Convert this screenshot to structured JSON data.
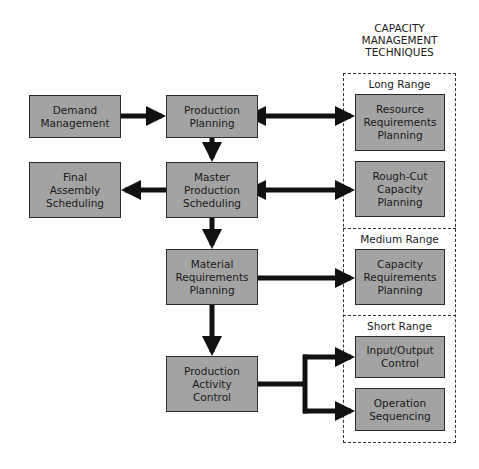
{
  "diagram": {
    "heading": "CAPACITY\nMANAGEMENT\nTECHNIQUES",
    "ranges": {
      "long": "Long Range",
      "medium": "Medium Range",
      "short": "Short Range"
    },
    "left_column": {
      "demand_management": "Demand\nManagement",
      "final_assembly_scheduling": "Final\nAssembly\nScheduling"
    },
    "center_column": {
      "production_planning": "Production\nPlanning",
      "master_production_scheduling": "Master\nProduction\nScheduling",
      "material_requirements_planning": "Material\nRequirements\nPlanning",
      "production_activity_control": "Production\nActivity\nControl"
    },
    "right_column": {
      "resource_requirements_planning": "Resource\nRequirements\nPlanning",
      "rough_cut_capacity_planning": "Rough-Cut\nCapacity\nPlanning",
      "capacity_requirements_planning": "Capacity\nRequirements\nPlanning",
      "input_output_control": "Input/Output\nControl",
      "operation_sequencing": "Operation\nSequencing"
    },
    "colors": {
      "box_fill": "#a3a3a3",
      "box_border": "#2a2a2a",
      "arrow": "#111111"
    }
  }
}
